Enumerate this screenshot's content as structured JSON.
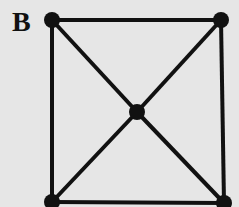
{
  "figure": {
    "label": "B",
    "background": "#e6e6e6",
    "stroke": "#111111",
    "nodes": [
      {
        "id": "top-left",
        "x": 52,
        "y": 20
      },
      {
        "id": "top-right",
        "x": 221,
        "y": 20
      },
      {
        "id": "center",
        "x": 137,
        "y": 112
      },
      {
        "id": "bottom-left",
        "x": 52,
        "y": 202
      },
      {
        "id": "bottom-right",
        "x": 224,
        "y": 203
      }
    ],
    "edges": [
      [
        "top-left",
        "top-right"
      ],
      [
        "top-left",
        "bottom-left"
      ],
      [
        "top-right",
        "bottom-right"
      ],
      [
        "bottom-left",
        "bottom-right"
      ],
      [
        "top-left",
        "center"
      ],
      [
        "center",
        "bottom-right"
      ],
      [
        "top-right",
        "center"
      ],
      [
        "center",
        "bottom-left"
      ]
    ]
  }
}
